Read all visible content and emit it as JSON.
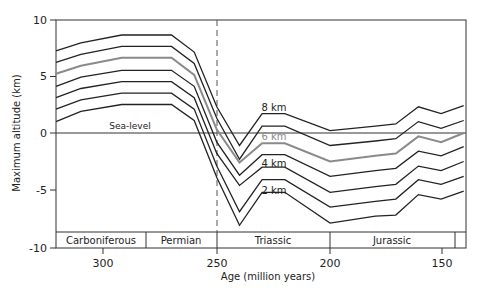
{
  "chart_data": {
    "type": "line",
    "title": "",
    "xlabel": "Age (million years)",
    "ylabel": "Maximum altitude (km)",
    "xlim": [
      320,
      139
    ],
    "ylim": [
      -10,
      10
    ],
    "x_ticks": [
      300,
      250,
      200,
      150
    ],
    "y_ticks": [
      10,
      5,
      0,
      -5,
      -10
    ],
    "grid": false,
    "legend": null,
    "x": [
      320,
      309,
      291,
      269,
      259,
      249,
      239,
      229,
      219,
      199,
      179,
      170,
      160,
      150,
      140
    ],
    "series": [
      {
        "name": "line-1",
        "color": "#222222",
        "values": [
          7.2,
          7.9,
          8.6,
          8.6,
          7.1,
          2.3,
          -1.1,
          1.7,
          1.7,
          0.2,
          0.6,
          0.8,
          2.3,
          1.7,
          2.4
        ]
      },
      {
        "name": "line-2 (8 km)",
        "color": "#222222",
        "values": [
          6.2,
          6.9,
          7.6,
          7.6,
          6.1,
          1.3,
          -2.3,
          0.6,
          0.6,
          -1.1,
          -0.7,
          -0.5,
          1.0,
          0.4,
          1.1
        ]
      },
      {
        "name": "line-3 (6 km)",
        "color": "#8a8a8a",
        "values": [
          5.2,
          5.9,
          6.6,
          6.6,
          5.1,
          0.3,
          -2.6,
          -0.9,
          -0.9,
          -2.5,
          -2.0,
          -1.8,
          -0.3,
          -0.8,
          0.0
        ]
      },
      {
        "name": "line-4",
        "color": "#222222",
        "values": [
          4.1,
          4.9,
          5.5,
          5.5,
          4.1,
          -0.8,
          -3.7,
          -1.9,
          -1.9,
          -3.8,
          -3.3,
          -3.1,
          -1.6,
          -2.0,
          -1.2
        ]
      },
      {
        "name": "line-5 (4 km)",
        "color": "#222222",
        "values": [
          3.1,
          3.9,
          4.5,
          4.5,
          3.1,
          -1.8,
          -4.6,
          -3.0,
          -3.0,
          -5.2,
          -4.7,
          -4.5,
          -2.9,
          -3.3,
          -2.5
        ]
      },
      {
        "name": "line-6 (2 km)",
        "color": "#222222",
        "values": [
          2.1,
          2.9,
          3.5,
          3.5,
          2.1,
          -2.9,
          -6.9,
          -4.1,
          -4.1,
          -6.5,
          -6.0,
          -5.8,
          -4.1,
          -4.5,
          -3.8
        ]
      },
      {
        "name": "line-7",
        "color": "#222222",
        "values": [
          1.0,
          1.9,
          2.5,
          2.5,
          1.1,
          -3.9,
          -8.1,
          -5.2,
          -5.2,
          -7.9,
          -7.3,
          -7.2,
          -5.4,
          -5.8,
          -5.1
        ]
      }
    ],
    "annotations": [
      {
        "text": "Sea-level",
        "x": 300,
        "y": 0.3
      },
      {
        "text": "8 km",
        "x": 226,
        "y": 2.1
      },
      {
        "text": "6 km",
        "x": 226,
        "y": -0.6
      },
      {
        "text": "4 km",
        "x": 226,
        "y": -2.9
      },
      {
        "text": "2 km",
        "x": 226,
        "y": -5.3
      }
    ],
    "reference_lines": [
      {
        "type": "horizontal",
        "y": 0,
        "label": "Sea-level"
      },
      {
        "type": "vertical",
        "x": 250,
        "style": "dashed"
      }
    ],
    "periods": [
      {
        "name": "Carboniferous",
        "from": 320,
        "to": 280
      },
      {
        "name": "Permian",
        "from": 280,
        "to": 250
      },
      {
        "name": "Triassic",
        "from": 250,
        "to": 200
      },
      {
        "name": "Jurassic",
        "from": 200,
        "to": 145
      },
      {
        "name": "",
        "from": 145,
        "to": 139
      }
    ]
  },
  "labels": {
    "ylabel": "Maximum altitude (km)",
    "xlabel": "Age (million years)",
    "sea_level": "Sea-level",
    "km8": "8 km",
    "km6": "6 km",
    "km4": "4 km",
    "km2": "2 km",
    "y10": "10",
    "y5": "5",
    "y0": "0",
    "ym5": "-5",
    "ym10": "-10",
    "x300": "300",
    "x250": "250",
    "x200": "200",
    "x150": "150",
    "p_carb": "Carboniferous",
    "p_perm": "Permian",
    "p_tri": "Triassic",
    "p_jur": "Jurassic"
  }
}
